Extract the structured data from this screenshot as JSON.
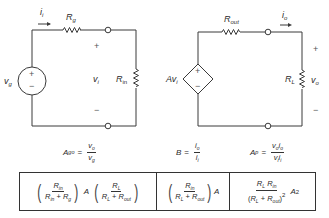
{
  "input_circuit": {
    "current_label": "i",
    "current_sub": "i",
    "source_resistor_label": "R",
    "source_resistor_sub": "g",
    "source_label": "v",
    "source_sub": "g",
    "source_plus": "+",
    "source_minus": "−",
    "input_voltage_label": "v",
    "input_voltage_sub": "i",
    "input_voltage_plus": "+",
    "input_voltage_minus": "−",
    "input_resistor_label": "R",
    "input_resistor_sub": "in"
  },
  "output_circuit": {
    "dependent_source_label": "Av",
    "dependent_source_sub": "i",
    "dependent_plus": "+",
    "dependent_minus": "−",
    "output_resistor_label": "R",
    "output_resistor_sub": "out",
    "current_label": "i",
    "current_sub": "o",
    "load_resistor_label": "R",
    "load_resistor_sub": "L",
    "output_voltage_label": "v",
    "output_voltage_sub": "o",
    "output_voltage_plus": "+",
    "output_voltage_minus": "−"
  },
  "definitions": {
    "voltage_gain": {
      "lhs": "A",
      "lhs_sub": "go",
      "eq": "=",
      "num": "v",
      "num_sub": "o",
      "den": "v",
      "den_sub": "g"
    },
    "current_gain": {
      "lhs": "B",
      "eq": "=",
      "num": "i",
      "num_sub": "o",
      "den": "i",
      "den_sub": "i"
    },
    "power_gain": {
      "lhs": "A",
      "lhs_sub": "p",
      "eq": "=",
      "num": "v",
      "num_sub": "o",
      "num2": "i",
      "num2_sub": "o",
      "den": "v",
      "den_sub": "i",
      "den2": "i",
      "den2_sub": "i"
    }
  },
  "formulas": {
    "voltage_gain": {
      "frac1_num": "R",
      "frac1_num_sub": "in",
      "frac1_den_a": "R",
      "frac1_den_a_sub": "in",
      "frac1_plus": "+",
      "frac1_den_b": "R",
      "frac1_den_b_sub": "g",
      "middle": "A",
      "frac2_num": "R",
      "frac2_num_sub": "L",
      "frac2_den_a": "R",
      "frac2_den_a_sub": "L",
      "frac2_plus": "+",
      "frac2_den_b": "R",
      "frac2_den_b_sub": "out"
    },
    "current_gain": {
      "num": "R",
      "num_sub": "in",
      "den_a": "R",
      "den_a_sub": "L",
      "plus": "+",
      "den_b": "R",
      "den_b_sub": "out",
      "factor": "A"
    },
    "power_gain": {
      "num_a": "R",
      "num_a_sub": "L",
      "num_b": "R",
      "num_b_sub": "in",
      "den_open": "(",
      "den_a": "R",
      "den_a_sub": "L",
      "plus": "+",
      "den_b": "R",
      "den_b_sub": "out",
      "den_close": ")",
      "den_exp": "2",
      "factor": "A",
      "factor_exp": "2"
    }
  }
}
